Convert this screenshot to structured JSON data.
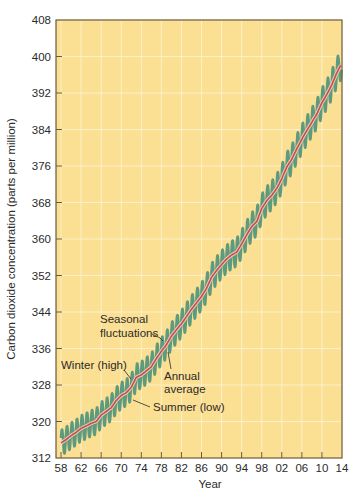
{
  "chart_data": {
    "type": "line",
    "title": "",
    "xlabel": "Year",
    "ylabel": "Carbon dioxide concentration (parts per million)",
    "xlim": [
      1957,
      2014
    ],
    "ylim": [
      312,
      408
    ],
    "grid": true,
    "legend": "none (inline annotations)",
    "x_tick_labels": [
      "58",
      "62",
      "66",
      "70",
      "74",
      "78",
      "82",
      "86",
      "90",
      "94",
      "98",
      "02",
      "06",
      "10",
      "14"
    ],
    "x_tick_values": [
      1958,
      1962,
      1966,
      1970,
      1974,
      1978,
      1982,
      1986,
      1990,
      1994,
      1998,
      2002,
      2006,
      2010,
      2014
    ],
    "y_tick_labels": [
      "312",
      "320",
      "328",
      "336",
      "344",
      "352",
      "360",
      "368",
      "376",
      "384",
      "392",
      "400",
      "408"
    ],
    "y_tick_values": [
      312,
      320,
      328,
      336,
      344,
      352,
      360,
      368,
      376,
      384,
      392,
      400,
      408
    ],
    "series": [
      {
        "name": "Annual average",
        "color": "#c0504d",
        "x": [
          1958,
          1959,
          1960,
          1961,
          1962,
          1963,
          1964,
          1965,
          1966,
          1967,
          1968,
          1969,
          1970,
          1971,
          1972,
          1973,
          1974,
          1975,
          1976,
          1977,
          1978,
          1979,
          1980,
          1981,
          1982,
          1983,
          1984,
          1985,
          1986,
          1987,
          1988,
          1989,
          1990,
          1991,
          1992,
          1993,
          1994,
          1995,
          1996,
          1997,
          1998,
          1999,
          2000,
          2001,
          2002,
          2003,
          2004,
          2005,
          2006,
          2007,
          2008,
          2009,
          2010,
          2011,
          2012,
          2013,
          2014
        ],
        "values": [
          315.3,
          316.0,
          316.9,
          317.6,
          318.5,
          319.0,
          319.6,
          320.0,
          321.4,
          322.2,
          323.0,
          324.6,
          325.7,
          326.3,
          327.5,
          329.7,
          330.2,
          331.1,
          332.0,
          333.8,
          335.4,
          336.8,
          338.7,
          340.1,
          341.4,
          343.0,
          344.6,
          346.0,
          347.4,
          349.2,
          351.6,
          353.1,
          354.4,
          355.6,
          356.5,
          357.1,
          358.9,
          360.9,
          362.7,
          363.8,
          366.7,
          368.4,
          369.6,
          371.1,
          373.2,
          375.8,
          377.5,
          379.8,
          381.9,
          383.8,
          385.6,
          387.4,
          389.9,
          391.7,
          393.9,
          396.5,
          398.6
        ]
      },
      {
        "name": "Seasonal fluctuations",
        "color": "#5e9a7e",
        "description": "Monthly values oscillating about the annual average with ~±3 ppm amplitude; winter (high) peaks and summer (low) troughs"
      }
    ],
    "annotations": [
      {
        "text": "Seasonal fluctuations",
        "lines": [
          "Seasonal",
          "fluctuations"
        ],
        "points_to": "seasonal curve near 1979"
      },
      {
        "text": "Annual average",
        "lines": [
          "Annual",
          "average"
        ],
        "points_to": "red average line near 1980"
      },
      {
        "text": "Winter (high)",
        "points_to": "seasonal peak near 1972"
      },
      {
        "text": "Summer (low)",
        "points_to": "seasonal trough near 1972"
      }
    ]
  },
  "labels": {
    "ylabel": "Carbon dioxide concentration (parts per million)",
    "xlabel": "Year",
    "annot_seasonal_1": "Seasonal",
    "annot_seasonal_2": "fluctuations",
    "annot_annual_1": "Annual",
    "annot_annual_2": "average",
    "annot_winter": "Winter (high)",
    "annot_summer": "Summer (low)"
  },
  "style": {
    "plot_bg": "#fbdf92",
    "grid_color": "#fdf0c8",
    "frame_color": "#6b5a3a",
    "seasonal_color": "#5e9a7e",
    "average_color": "#c0504d"
  }
}
